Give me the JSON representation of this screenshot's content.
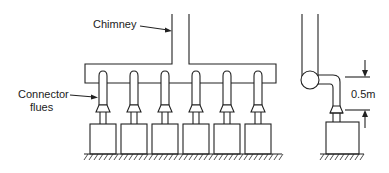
{
  "diagram": {
    "labels": {
      "chimney": "Chimney",
      "connector_line1": "Connector",
      "connector_line2": "flues",
      "dimension": "0.5m"
    },
    "left_assembly": {
      "appliance_count": 6,
      "flue_centers_x": [
        103,
        134,
        165,
        196,
        227,
        258
      ]
    },
    "right_assembly": {
      "appliance_count": 1
    },
    "colors": {
      "line": "#222222",
      "background": "#ffffff"
    }
  }
}
